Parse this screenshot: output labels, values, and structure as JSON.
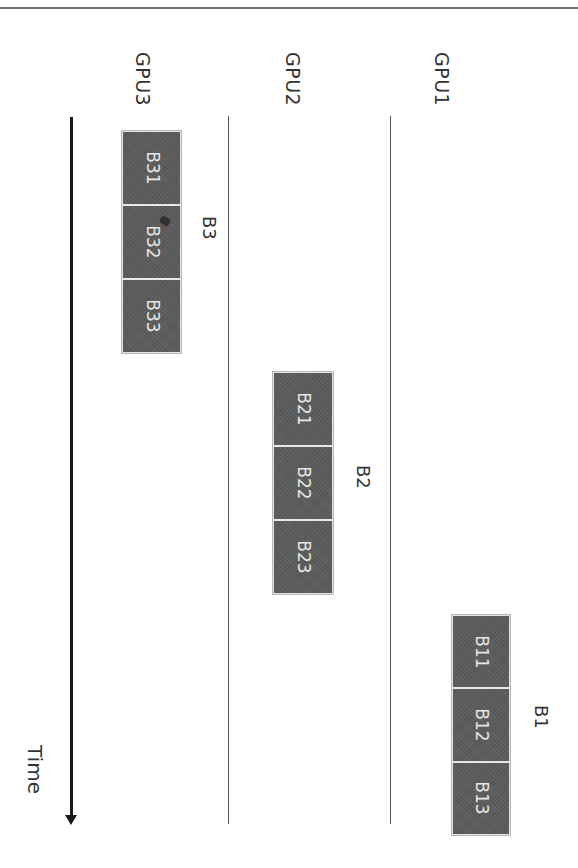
{
  "diagram": {
    "title": "",
    "axis": {
      "label": "Time",
      "direction": "down"
    },
    "lanes": [
      {
        "id": "gpu3",
        "label": "GPU3"
      },
      {
        "id": "gpu2",
        "label": "GPU2"
      },
      {
        "id": "gpu1",
        "label": "GPU1"
      }
    ],
    "groups": [
      {
        "label": "B3",
        "lane": "GPU3",
        "blocks": [
          {
            "label": "B31"
          },
          {
            "label": "B32"
          },
          {
            "label": "B33"
          }
        ]
      },
      {
        "label": "B2",
        "lane": "GPU2",
        "blocks": [
          {
            "label": "B21"
          },
          {
            "label": "B22"
          },
          {
            "label": "B23"
          }
        ]
      },
      {
        "label": "B1",
        "lane": "GPU1",
        "blocks": [
          {
            "label": "B11"
          },
          {
            "label": "B12"
          },
          {
            "label": "B13"
          }
        ]
      }
    ],
    "colors": {
      "block_fill": "#5c5c5c",
      "block_text": "#e6e6e6",
      "lane_line": "#555555",
      "arrow": "#1a1a1a",
      "rule": "#6e6e6e"
    }
  }
}
